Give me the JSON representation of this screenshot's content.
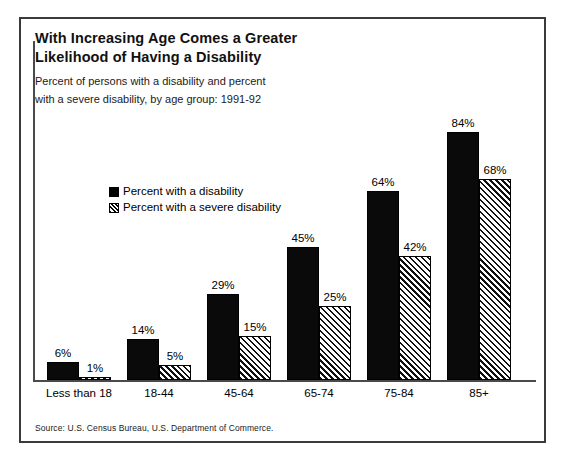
{
  "figure": {
    "title_lines": [
      "With Increasing Age Comes a Greater",
      "Likelihood of Having a Disability"
    ],
    "subtitle_lines": [
      "Percent of persons with a disability and percent",
      "with a severe disability, by age group:  1991-92"
    ],
    "source": "Source:  U.S. Census Bureau, U.S. Department of Commerce."
  },
  "chart_data": {
    "type": "bar",
    "title": "With Increasing Age Comes a Greater Likelihood of Having a Disability",
    "subtitle": "Percent of persons with a disability and percent with a severe disability, by age group:  1991-92",
    "xlabel": "",
    "ylabel": "",
    "ylim": [
      0,
      100
    ],
    "grid": false,
    "legend_position": "upper-left-inside",
    "categories": [
      "Less than 18",
      "18-44",
      "45-64",
      "65-74",
      "75-84",
      "85+"
    ],
    "series": [
      {
        "name": "Percent with a disability",
        "fill": "solid-black",
        "color": "#000000",
        "values": [
          6,
          14,
          29,
          45,
          64,
          84
        ],
        "labels": [
          "6%",
          "14%",
          "29%",
          "45%",
          "64%",
          "84%"
        ]
      },
      {
        "name": "Percent with a severe disability",
        "fill": "diagonal-hatch",
        "color": "#000000",
        "values": [
          1,
          5,
          15,
          25,
          42,
          68
        ],
        "labels": [
          "1%",
          "5%",
          "15%",
          "25%",
          "42%",
          "68%"
        ]
      }
    ],
    "source": "Source:  U.S. Census Bureau, U.S. Department of Commerce."
  }
}
